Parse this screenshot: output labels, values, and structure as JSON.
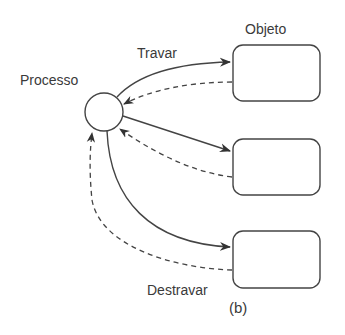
{
  "labels": {
    "process": "Processo",
    "object": "Objeto",
    "lock": "Travar",
    "unlock": "Destravar",
    "caption": "(b)"
  },
  "diagram": {
    "nodes": [
      {
        "id": "processo",
        "shape": "circle",
        "label": "Processo"
      },
      {
        "id": "obj1",
        "shape": "rounded-rect",
        "label": "Objeto"
      },
      {
        "id": "obj2",
        "shape": "rounded-rect",
        "label": ""
      },
      {
        "id": "obj3",
        "shape": "rounded-rect",
        "label": ""
      }
    ],
    "edges": [
      {
        "from": "processo",
        "to": "obj1",
        "style": "solid",
        "label": "Travar"
      },
      {
        "from": "obj1",
        "to": "processo",
        "style": "dashed"
      },
      {
        "from": "processo",
        "to": "obj2",
        "style": "solid"
      },
      {
        "from": "obj2",
        "to": "processo",
        "style": "dashed"
      },
      {
        "from": "processo",
        "to": "obj3",
        "style": "solid"
      },
      {
        "from": "obj3",
        "to": "processo",
        "style": "dashed",
        "label": "Destravar"
      }
    ]
  }
}
